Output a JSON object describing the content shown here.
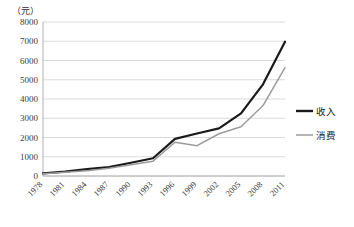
{
  "chart_data": {
    "type": "line",
    "title": "",
    "subtitle": "",
    "xlabel": "",
    "ylabel": "（元）",
    "unit_label": "（元）",
    "x": [
      1978,
      1981,
      1984,
      1987,
      1990,
      1993,
      1996,
      1999,
      2002,
      2005,
      2008,
      2011
    ],
    "categories": [
      "1978",
      "1981",
      "1984",
      "1987",
      "1990",
      "1993",
      "1996",
      "1999",
      "2002",
      "2005",
      "2008",
      "2011"
    ],
    "xlim": [
      1978,
      2011
    ],
    "ylim": [
      0,
      8000
    ],
    "yticks": [
      0,
      1000,
      2000,
      3000,
      4000,
      5000,
      6000,
      7000,
      8000
    ],
    "ytick_labels": [
      "0",
      "1000",
      "2000",
      "3000",
      "4000",
      "5000",
      "6000",
      "7000",
      "8000"
    ],
    "grid": true,
    "grid_axis": "y",
    "legend_position": "right",
    "series": [
      {
        "name": "收入",
        "color": "#1a1a1a",
        "width": 2.2,
        "values": [
          134,
          223,
          355,
          463,
          686,
          922,
          1926,
          2210,
          2476,
          3255,
          4761,
          6977
        ]
      },
      {
        "name": "消费",
        "color": "#9b9b9b",
        "width": 1.5,
        "values": [
          116,
          191,
          274,
          398,
          585,
          770,
          1756,
          1577,
          2195,
          2555,
          3661,
          5633
        ]
      }
    ],
    "annotations": []
  },
  "legend": {
    "items": [
      {
        "label": "收入",
        "color": "#1a1a1a"
      },
      {
        "label": "消费",
        "color": "#9b9b9b"
      }
    ]
  },
  "colors": {
    "income": "#1a1a1a",
    "consumption": "#9b9b9b",
    "grid": "#d0d0d0",
    "axis": "#b8b8b8",
    "text": "#333333",
    "background": "#ffffff"
  }
}
